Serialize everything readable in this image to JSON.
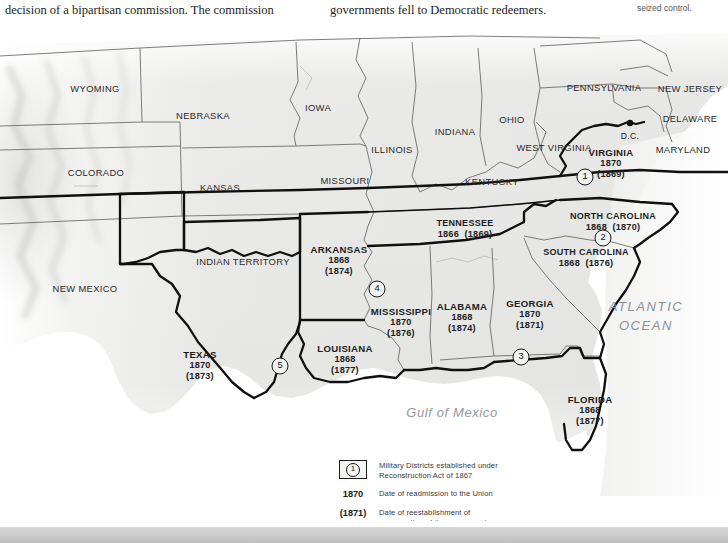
{
  "page": {
    "body_text_left": "decision of a bipartisan commission. The commission",
    "body_text_middle": "governments fell to Democratic redeemers.",
    "body_text_right": "seized control."
  },
  "map": {
    "title": "Reconstruction Military Districts and Readmission Dates",
    "ocean_labels": [
      {
        "name": "atlantic-ocean",
        "line1": "ATLANTIC",
        "line2": "OCEAN"
      },
      {
        "name": "gulf-of-mexico",
        "text": "Gulf of Mexico"
      }
    ],
    "capital": {
      "label": "D.C."
    },
    "colors": {
      "land": "#e6e6e4",
      "land_shade": "#d5d5d3",
      "water": "#fbfbfb",
      "state_border": "#5a5a5a",
      "district_border": "#141414",
      "text": "#1d1d1d",
      "ocean_text": "#8d9095"
    },
    "plain_states": [
      {
        "name": "wyoming",
        "label": "WYOMING",
        "x": 95,
        "y": 63
      },
      {
        "name": "nebraska",
        "label": "NEBRASKA",
        "x": 203,
        "y": 90
      },
      {
        "name": "iowa",
        "label": "IOWA",
        "x": 318,
        "y": 82
      },
      {
        "name": "illinois",
        "label": "ILLINOIS",
        "x": 392,
        "y": 124
      },
      {
        "name": "indiana",
        "label": "INDIANA",
        "x": 455,
        "y": 106
      },
      {
        "name": "ohio",
        "label": "OHIO",
        "x": 512,
        "y": 94
      },
      {
        "name": "pennsylvania",
        "label": "PENNSYLVANIA",
        "x": 604,
        "y": 62
      },
      {
        "name": "new-jersey",
        "label": "NEW\nJERSEY",
        "x": 690,
        "y": 63
      },
      {
        "name": "delaware",
        "label": "DELAWARE",
        "x": 690,
        "y": 93
      },
      {
        "name": "maryland",
        "label": "MARYLAND",
        "x": 683,
        "y": 124
      },
      {
        "name": "west-virginia",
        "label": "WEST\nVIRGINIA",
        "x": 554,
        "y": 122
      },
      {
        "name": "kentucky",
        "label": "KENTUCKY",
        "x": 492,
        "y": 156
      },
      {
        "name": "missouri",
        "label": "MISSOURI",
        "x": 345,
        "y": 155
      },
      {
        "name": "kansas",
        "label": "KANSAS",
        "x": 220,
        "y": 162
      },
      {
        "name": "colorado",
        "label": "COLORADO",
        "x": 96,
        "y": 147
      },
      {
        "name": "new-mexico",
        "label": "NEW\nMEXICO",
        "x": 85,
        "y": 263
      },
      {
        "name": "indian-territory",
        "label": "INDIAN\nTERRITORY",
        "x": 243,
        "y": 236
      }
    ],
    "reconstruction_states": [
      {
        "name": "virginia",
        "label": "VIRGINIA",
        "readmission": "1870",
        "conservative": "(1869)",
        "x": 611,
        "y": 138
      },
      {
        "name": "north-carolina",
        "label": "NORTH CAROLINA",
        "readmission": "1868",
        "conservative": "(1870)",
        "inline": true,
        "x": 613,
        "y": 196
      },
      {
        "name": "south-carolina",
        "label": "SOUTH CAROLINA",
        "readmission": "1868",
        "conservative": "(1876)",
        "inline": true,
        "x": 586,
        "y": 232
      },
      {
        "name": "tennessee",
        "label": "TENNESSEE",
        "readmission": "1866",
        "conservative": "(1869)",
        "inline": true,
        "x": 465,
        "y": 203
      },
      {
        "name": "arkansas",
        "label": "ARKANSAS",
        "readmission": "1868",
        "conservative": "(1874)",
        "x": 339,
        "y": 235
      },
      {
        "name": "mississippi",
        "label": "MISSISSIPPI",
        "readmission": "1870",
        "conservative": "(1876)",
        "x": 401,
        "y": 297
      },
      {
        "name": "alabama",
        "label": "ALABAMA",
        "readmission": "1868",
        "conservative": "(1874)",
        "x": 462,
        "y": 292
      },
      {
        "name": "georgia",
        "label": "GEORGIA",
        "readmission": "1870",
        "conservative": "(1871)",
        "x": 530,
        "y": 289
      },
      {
        "name": "louisiana",
        "label": "LOUISIANA",
        "readmission": "1868",
        "conservative": "(1877)",
        "x": 345,
        "y": 334
      },
      {
        "name": "texas",
        "label": "TEXAS",
        "readmission": "1870",
        "conservative": "(1873)",
        "x": 200,
        "y": 340
      },
      {
        "name": "florida",
        "label": "FLORIDA",
        "readmission": "1868",
        "conservative": "(1877)",
        "x": 590,
        "y": 385
      }
    ],
    "military_districts": [
      {
        "name": "district-1",
        "number": "1",
        "x": 585,
        "y": 151
      },
      {
        "name": "district-2",
        "number": "2",
        "x": 603,
        "y": 212
      },
      {
        "name": "district-3",
        "number": "3",
        "x": 521,
        "y": 331
      },
      {
        "name": "district-4",
        "number": "4",
        "x": 377,
        "y": 263
      },
      {
        "name": "district-5",
        "number": "5",
        "x": 280,
        "y": 340
      }
    ]
  },
  "legend": {
    "rows": [
      {
        "name": "legend-military-districts",
        "key_type": "boxed-number",
        "key_value": "1",
        "description": "Military Districts established under\nReconstruction Act of 1867"
      },
      {
        "name": "legend-readmission-date",
        "key_type": "year",
        "key_value": "1870",
        "description": "Date of readmission to the Union"
      },
      {
        "name": "legend-conservative-date",
        "key_type": "year",
        "key_value": "(1871)",
        "description": "Date of reestablishment of\nconservative white government"
      }
    ]
  }
}
